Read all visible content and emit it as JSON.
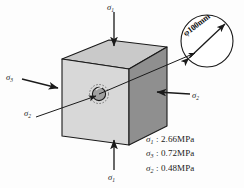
{
  "figure": {
    "background_color": "#fdfdfd"
  },
  "cube": {
    "top_face_color": "#c9c9c9",
    "front_face_color": "#d7d7d7",
    "right_face_color": "#8f8f8f",
    "edge_color": "#1a1a1a"
  },
  "hole": {
    "label": "hole",
    "inner_fill": "#9a9a9a",
    "dashed_ring": true
  },
  "callout": {
    "name": "detail-circle",
    "diameter_label": "φ100mm",
    "circle_stroke": "#1a1a1a"
  },
  "axis_labels": {
    "top": {
      "symbol": "σ",
      "subscript": "1"
    },
    "bottom": {
      "symbol": "σ",
      "subscript": "1"
    },
    "left": {
      "symbol": "σ",
      "subscript": "3"
    },
    "right": {
      "symbol": "σ",
      "subscript": "2"
    },
    "diagonal": {
      "symbol": "σ",
      "subscript": "2"
    }
  },
  "stress_values": [
    {
      "symbol": "σ",
      "subscript": "1",
      "separator": " : ",
      "value": "2.66MPa"
    },
    {
      "symbol": "σ",
      "subscript": "3",
      "separator": " : ",
      "value": "0.72MPa"
    },
    {
      "symbol": "σ",
      "subscript": "2",
      "separator": " : ",
      "value": "0.48MPa"
    }
  ]
}
